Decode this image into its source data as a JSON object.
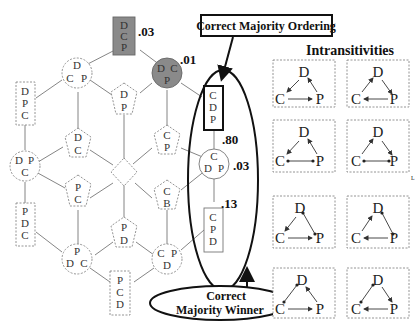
{
  "callouts": {
    "ordering": "Correct Majority Ordering",
    "winner_line1": "Correct",
    "winner_line2": "Majority Winner"
  },
  "intransitivities": {
    "title": "Intransitivities",
    "labels": {
      "d": "D",
      "c": "C",
      "p": "P"
    }
  },
  "values": {
    "dcp_top": ".03",
    "dcp_circle": ".01",
    "cdp_box": ".80",
    "cdp_circle": ".03",
    "cpd_box": ".13"
  },
  "nodes": {
    "top_box": [
      "D",
      "C",
      "P"
    ],
    "circle_dcp_left": [
      "D",
      "C",
      "P"
    ],
    "circle_dcp_shaded": [
      "D",
      "C",
      "P"
    ],
    "rect_dpc": [
      "D",
      "P",
      "C"
    ],
    "pent_dp": [
      "D",
      "P"
    ],
    "pent_dc": [
      "D",
      "C"
    ],
    "pent_cp": [
      "C",
      "P"
    ],
    "box_cdp": [
      "C",
      "D",
      "P"
    ],
    "circle_dpc": [
      "D",
      "P",
      "C"
    ],
    "circle_cdp": [
      "C",
      "D",
      "P"
    ],
    "pent_pc": [
      "P",
      "C"
    ],
    "pent_cb": [
      "C",
      "B"
    ],
    "rect_pdc": [
      "P",
      "D",
      "C"
    ],
    "pent_pd": [
      "P",
      "D"
    ],
    "box_cpd": [
      "C",
      "P",
      "D"
    ],
    "circle_pdc": [
      "P",
      "D",
      "C"
    ],
    "circle_cpd": [
      "C",
      "P",
      "D"
    ],
    "rect_pcd": [
      "P",
      "C",
      "D"
    ]
  }
}
